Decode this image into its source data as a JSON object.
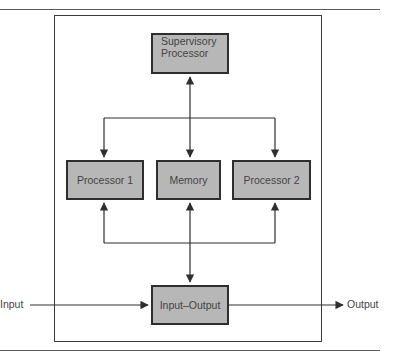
{
  "diagram": {
    "nodes": {
      "supervisory": {
        "line1": "Supervisory",
        "line2": "Processor"
      },
      "processor1": "Processor 1",
      "memory": "Memory",
      "processor2": "Processor 2",
      "io": "Input–Output"
    },
    "external": {
      "input": "Input",
      "output": "Output"
    },
    "edges": [
      {
        "from": "supervisory",
        "to": "bus-top",
        "bidirectional": true
      },
      {
        "from": "bus-top",
        "to": "processor1"
      },
      {
        "from": "bus-top",
        "to": "memory"
      },
      {
        "from": "bus-top",
        "to": "processor2"
      },
      {
        "from": "bus-bottom",
        "to": "processor1"
      },
      {
        "from": "bus-bottom",
        "to": "processor2"
      },
      {
        "from": "memory",
        "to": "io",
        "bidirectional": true
      },
      {
        "from": "input",
        "to": "io"
      },
      {
        "from": "io",
        "to": "output"
      }
    ],
    "colors": {
      "box_fill": "#b7b7b7",
      "stroke": "#2e2e2e"
    }
  }
}
